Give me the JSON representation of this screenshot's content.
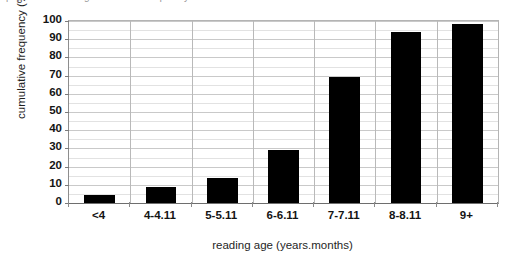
{
  "caption": {
    "clipped_text": "pupils at a reading cumulative frequency bar chart at a start line"
  },
  "chart_data": {
    "type": "bar",
    "title": "",
    "xlabel": "reading age (years.months)",
    "ylabel": "cumulative frequency (%)",
    "categories": [
      "<4",
      "4-4.11",
      "5-5.11",
      "6-6.11",
      "7-7.11",
      "8-8.11",
      "9+"
    ],
    "values": [
      4.5,
      9,
      14,
      29,
      69,
      94,
      98.5
    ],
    "ylim": [
      0,
      100
    ],
    "ytick_values": [
      0,
      10,
      20,
      30,
      40,
      50,
      60,
      70,
      80,
      90,
      100
    ],
    "ytick_labels": [
      "0",
      "10",
      "20",
      "30",
      "40",
      "50",
      "60",
      "70",
      "80",
      "90",
      "100"
    ],
    "grid": true,
    "legend": false,
    "bar_color": "#000000",
    "gridline_color": "#c9c9c9",
    "axis_color": "#6e6e6e",
    "background": "#ffffff"
  }
}
